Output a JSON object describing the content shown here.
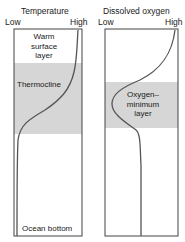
{
  "panels": [
    {
      "title": "Temperature",
      "axis_low": "Low",
      "axis_high": "High",
      "labels": {
        "top": [
          "Warm",
          "surface",
          "layer"
        ],
        "band": "Thermocline",
        "bottom": "Ocean bottom"
      }
    },
    {
      "title": "Dissolved oxygen",
      "axis_low": "Low",
      "axis_high": "High",
      "labels": {
        "band": [
          "Oxygen–",
          "minimum",
          "layer"
        ]
      }
    }
  ],
  "colors": {
    "band": "#d6d6d6",
    "line": "#555555",
    "box": "#444444"
  }
}
